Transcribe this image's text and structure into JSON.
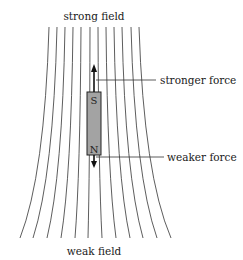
{
  "diagram": {
    "title_top": "strong field",
    "title_bottom": "weak field",
    "labels": {
      "upper_force": "stronger force",
      "lower_force": "weaker force"
    },
    "magnet": {
      "top_pole": "S",
      "bottom_pole": "N",
      "fill_color": "#a3a3a3"
    },
    "field_lines": {
      "count": 12,
      "top_x": [
        49,
        57,
        65,
        73,
        81,
        90,
        98,
        106,
        114,
        122,
        131,
        139
      ],
      "bottom_x": [
        20,
        33,
        47,
        61,
        75,
        88,
        102,
        116,
        130,
        143,
        157,
        171
      ],
      "top_y": 27,
      "bottom_y": 238,
      "color": "#333333"
    },
    "arrows": {
      "up": "force-up-arrow",
      "down": "force-down-arrow"
    }
  }
}
